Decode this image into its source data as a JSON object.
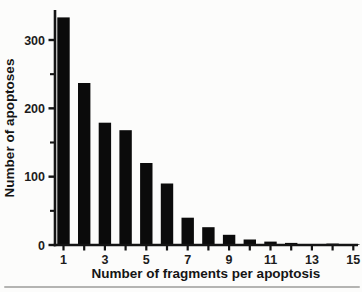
{
  "chart_data": {
    "type": "bar",
    "title": "",
    "xlabel": "Number of fragments per apoptosis",
    "ylabel": "Number of apoptoses",
    "categories": [
      1,
      2,
      3,
      4,
      5,
      6,
      7,
      8,
      9,
      10,
      11,
      12,
      13,
      14,
      15
    ],
    "values": [
      333,
      237,
      179,
      168,
      120,
      90,
      40,
      26,
      15,
      8,
      5,
      3,
      1,
      2,
      1
    ],
    "x_tick_labels_shown": [
      "1",
      "3",
      "5",
      "7",
      "9",
      "11",
      "13",
      "15"
    ],
    "y_ticks_major": [
      0,
      100,
      200,
      300
    ],
    "y_ticks_minor": [
      50,
      150,
      250
    ],
    "xlim": [
      0.4,
      15.7
    ],
    "ylim": [
      0,
      344
    ],
    "grid": false,
    "legend": false,
    "bar_color": "#0b0b0b",
    "axis_color": "#141414",
    "divider_color": "#b4b4b2"
  }
}
